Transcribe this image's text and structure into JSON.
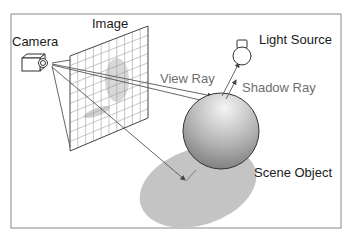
{
  "diagram": {
    "labels": {
      "camera": "Camera",
      "image": "Image",
      "light_source": "Light Source",
      "view_ray": "View Ray",
      "shadow_ray": "Shadow Ray",
      "scene_object": "Scene Object"
    },
    "colors": {
      "frame": "#8a8a8a",
      "line": "#444444",
      "grid": "#9a9a9a",
      "shadow": "#c4c4c4",
      "sphere_light": "#f2f2f2",
      "sphere_dark": "#7d7d7d",
      "label_dark": "#1a1a1a",
      "label_gray": "#6e6e6e"
    },
    "elements": [
      {
        "id": "camera",
        "type": "icon",
        "label": "Camera"
      },
      {
        "id": "image-plane",
        "type": "grid-plane",
        "label": "Image"
      },
      {
        "id": "light-source",
        "type": "bulb-icon",
        "label": "Light Source"
      },
      {
        "id": "scene-object",
        "type": "sphere",
        "label": "Scene Object"
      },
      {
        "id": "shadow",
        "type": "ellipse"
      }
    ],
    "connections": [
      {
        "from": "camera",
        "to": "scene-object",
        "label": "View Ray"
      },
      {
        "from": "scene-object",
        "to": "light-source",
        "label": "Shadow Ray"
      },
      {
        "from": "camera",
        "to": "shadow",
        "label": ""
      }
    ]
  }
}
